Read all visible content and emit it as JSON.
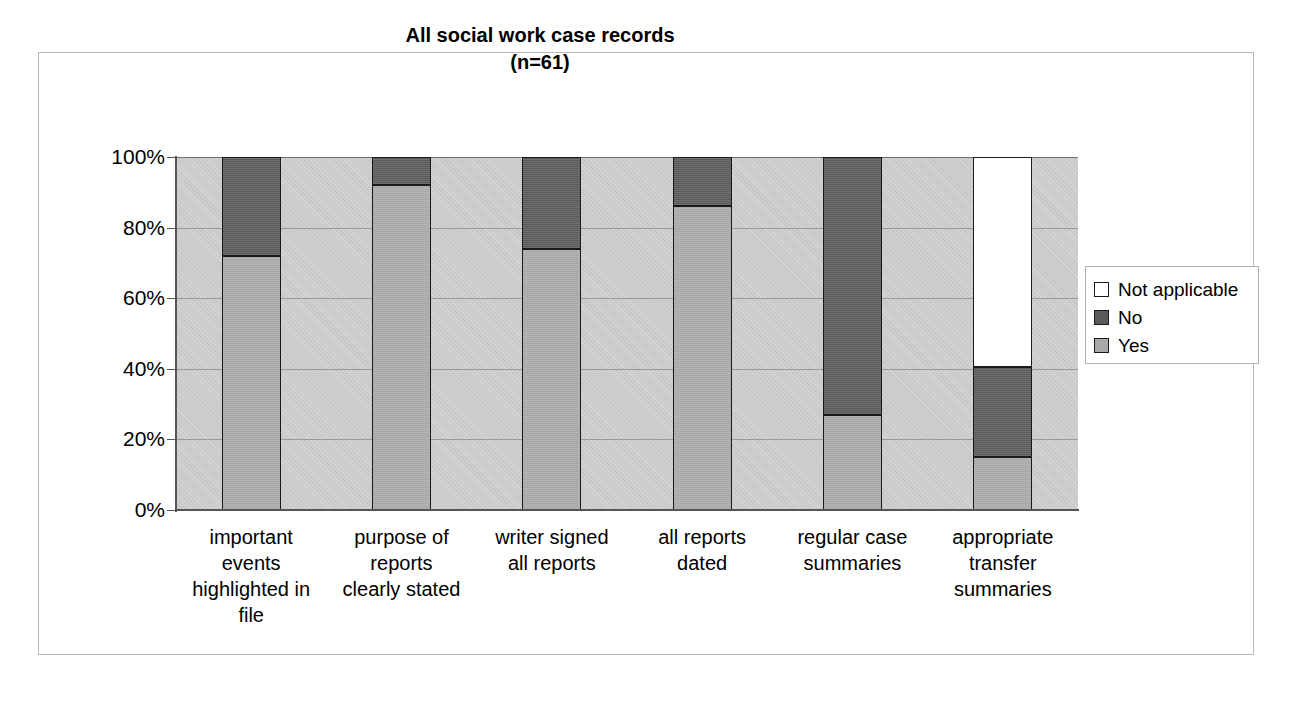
{
  "chart_data": {
    "type": "bar",
    "subtype": "stacked-100-percent",
    "title": "All social work case records",
    "subtitle": "(n=61)",
    "xlabel": "",
    "ylabel": "",
    "ylim": [
      0,
      100
    ],
    "ytick_labels": [
      "100%",
      "80%",
      "60%",
      "40%",
      "20%",
      "0%"
    ],
    "ytick_values": [
      100,
      80,
      60,
      40,
      20,
      0
    ],
    "grid": true,
    "legend_position": "right",
    "categories": [
      "important events highlighted in file",
      "purpose of reports clearly stated",
      "writer signed all reports",
      "all reports dated",
      "regular case summaries",
      "appropriate transfer summaries"
    ],
    "category_lines": [
      [
        "important",
        "events",
        "highlighted in",
        "file"
      ],
      [
        "purpose of",
        "reports",
        "clearly stated"
      ],
      [
        "writer signed",
        "all reports"
      ],
      [
        "all reports",
        "dated"
      ],
      [
        "regular case",
        "summaries"
      ],
      [
        "appropriate",
        "transfer",
        "summaries"
      ]
    ],
    "series": [
      {
        "name": "Yes",
        "color": "#a8a8a8",
        "values": [
          72,
          92,
          74,
          86,
          27,
          15
        ]
      },
      {
        "name": "No",
        "color": "#5a5a5a",
        "values": [
          28,
          8,
          26,
          14,
          73,
          25.5
        ]
      },
      {
        "name": "Not applicable",
        "color": "#ffffff",
        "values": [
          0,
          0,
          0,
          0,
          0,
          59.5
        ]
      }
    ]
  },
  "legend": {
    "items": [
      {
        "label": "Not applicable",
        "swatch": "na"
      },
      {
        "label": "No",
        "swatch": "no"
      },
      {
        "label": "Yes",
        "swatch": "yes"
      }
    ]
  }
}
